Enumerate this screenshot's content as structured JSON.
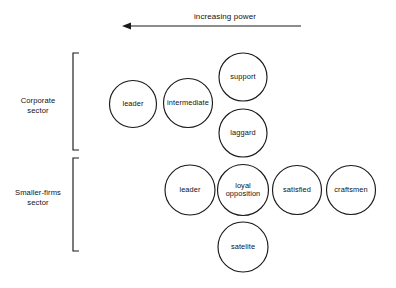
{
  "axis": {
    "label": "increasing power",
    "direction": "left",
    "line": {
      "x1": 122,
      "x2": 301,
      "y": 26
    },
    "label_pos": {
      "x": 225,
      "y": 19
    }
  },
  "sectors": [
    {
      "name": "corporate-sector",
      "label_line1": "Corporate",
      "label_line2": "sector",
      "label_x": 38,
      "label_y1": 103,
      "label_y2": 113,
      "bracket": {
        "x": 73,
        "y_top": 53,
        "y_bottom": 150,
        "tick": 6
      }
    },
    {
      "name": "smaller-firms-sector",
      "label_line1": "Smaller-firms",
      "label_line2": "sector",
      "label_x": 38,
      "label_y1": 195,
      "label_y2": 205,
      "bracket": {
        "x": 73,
        "y_top": 158,
        "y_bottom": 251,
        "tick": 6
      }
    }
  ],
  "nodes": [
    {
      "name": "leader-corporate",
      "sector": "corporate-sector",
      "lines": [
        "leader"
      ],
      "cx": 133,
      "cy": 104,
      "r": 23.5
    },
    {
      "name": "intermediate",
      "sector": "corporate-sector",
      "lines": [
        "intermediate"
      ],
      "cx": 188,
      "cy": 103,
      "r": 24.5
    },
    {
      "name": "support",
      "sector": "corporate-sector",
      "lines": [
        "support"
      ],
      "cx": 243,
      "cy": 77,
      "r": 24.0
    },
    {
      "name": "laggard",
      "sector": "corporate-sector",
      "lines": [
        "laggard"
      ],
      "cx": 243,
      "cy": 133,
      "r": 24.0
    },
    {
      "name": "leader-smaller-firms",
      "sector": "smaller-firms-sector",
      "lines": [
        "leader"
      ],
      "cx": 190,
      "cy": 190,
      "r": 25.0
    },
    {
      "name": "loyal-opposition",
      "sector": "smaller-firms-sector",
      "lines": [
        "loyal",
        "opposition"
      ],
      "cx": 243,
      "cy": 190,
      "r": 25.5
    },
    {
      "name": "satisfied",
      "sector": "smaller-firms-sector",
      "lines": [
        "satisfied"
      ],
      "cx": 297,
      "cy": 190,
      "r": 24.5
    },
    {
      "name": "craftsmen",
      "sector": "smaller-firms-sector",
      "lines": [
        "craftsmen"
      ],
      "cx": 351,
      "cy": 190,
      "r": 24.5
    },
    {
      "name": "satelite",
      "sector": "smaller-firms-sector",
      "lines": [
        "satelite"
      ],
      "cx": 243,
      "cy": 247,
      "r": 25.0
    }
  ],
  "colors": {
    "stroke": "#1a1a1a",
    "text": "#111111",
    "background": "#ffffff"
  }
}
